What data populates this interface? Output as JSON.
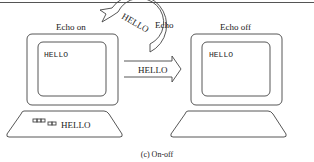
{
  "diagram": {
    "caption": "(c) On-off",
    "left_terminal": {
      "label": "Echo on",
      "screen_text": "HELLO",
      "keyboard_text": "HELLO"
    },
    "right_terminal": {
      "label": "Echo off",
      "screen_text": "HELLO"
    },
    "echo_arc": {
      "text": "HELLO",
      "label": "Echo"
    },
    "transmit_arrow": {
      "text": "HELLO"
    },
    "colors": {
      "stroke": "#444444",
      "text": "#222222",
      "background": "#ffffff"
    }
  }
}
